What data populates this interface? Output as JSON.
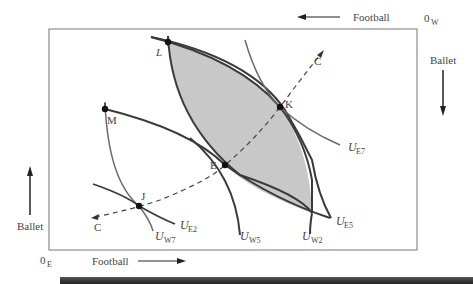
{
  "figure": {
    "type": "edgeworth-box",
    "origins": {
      "east": {
        "label": "0",
        "sub": "E"
      },
      "west": {
        "label": "0",
        "sub": "W"
      }
    },
    "axes": {
      "east_horizontal": "Football",
      "east_vertical": "Ballet",
      "west_horizontal": "Football",
      "west_vertical": "Ballet"
    },
    "points": [
      {
        "id": "L",
        "label": "L"
      },
      {
        "id": "K",
        "label": "K"
      },
      {
        "id": "E",
        "label": "E"
      },
      {
        "id": "M",
        "label": "M"
      },
      {
        "id": "J",
        "label": "J"
      }
    ],
    "contract_curve": {
      "label_top": "C",
      "label_bottom": "C"
    },
    "curves": [
      {
        "id": "UE7",
        "base": "U",
        "sub": "E7"
      },
      {
        "id": "UE5",
        "base": "U",
        "sub": "E5"
      },
      {
        "id": "UE2",
        "base": "U",
        "sub": "E2"
      },
      {
        "id": "UW7",
        "base": "U",
        "sub": "W7"
      },
      {
        "id": "UW5",
        "base": "U",
        "sub": "W5"
      },
      {
        "id": "UW2",
        "base": "U",
        "sub": "W2"
      }
    ],
    "colors": {
      "shaded_region": "#c8c8c8",
      "curve_dark": "#3a3a3a",
      "curve_gray": "#6a6a6a",
      "box": "#777777"
    }
  }
}
